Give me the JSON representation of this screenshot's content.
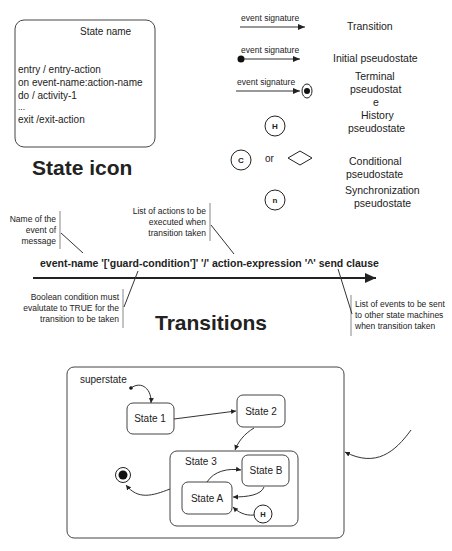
{
  "state_icon": {
    "state_name": "State name",
    "lines": [
      "entry / entry-action",
      "on event-name:action-name",
      "do / activity-1",
      "...",
      "exit /exit-action"
    ],
    "title": "State icon"
  },
  "legend": {
    "transition": {
      "signature": "event signature",
      "label": "Transition"
    },
    "initial": {
      "signature": "event signature",
      "label": "Initial pseudostate"
    },
    "terminal": {
      "signature": "event signature",
      "label_lines": [
        "Terminal",
        "pseudostat",
        "e"
      ]
    },
    "history": {
      "glyph": "H",
      "label_lines": [
        "History",
        "pseudostate"
      ]
    },
    "conditional": {
      "glyph": "C",
      "or": "or",
      "label_lines": [
        "Conditional",
        "pseudostate"
      ]
    },
    "synchronization": {
      "glyph": "n",
      "label_lines": [
        "Synchronization",
        "pseudostate"
      ]
    }
  },
  "transitions": {
    "syntax": "event-name '['guard-condition']' '/' action-expression '^' send clause",
    "title": "Transitions",
    "notes": {
      "event_name": [
        "Name of the",
        "event of",
        "message"
      ],
      "actions": [
        "List of actions to be",
        "executed when",
        "transition taken"
      ],
      "guard": [
        "Boolean condition must",
        "evalutate to TRUE for the",
        "transition to be taken"
      ],
      "send": [
        "List of events to be sent",
        "to other state machines",
        "when transition taken"
      ]
    }
  },
  "example": {
    "superstate": "superstate",
    "state1": "State 1",
    "state2": "State 2",
    "state3": "State 3",
    "stateA": "State A",
    "stateB": "State B",
    "history": "H"
  }
}
